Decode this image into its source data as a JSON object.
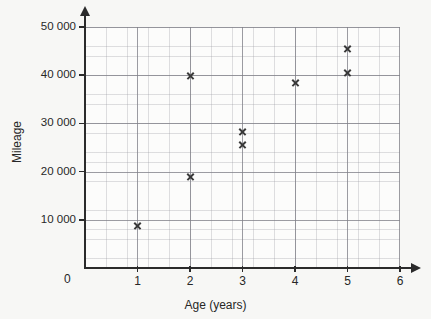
{
  "chart_data": {
    "type": "scatter",
    "title": "",
    "xlabel": "Age (years)",
    "ylabel": "Mileage",
    "xlim": [
      0,
      6
    ],
    "ylim": [
      0,
      50000
    ],
    "grid": true,
    "legend": "none",
    "x_ticks": [
      "0",
      "1",
      "2",
      "3",
      "4",
      "5",
      "6"
    ],
    "x_tick_values": [
      0,
      1,
      2,
      3,
      4,
      5,
      6
    ],
    "y_ticks": [
      "10 000",
      "20 000",
      "30 000",
      "40 000",
      "50 000"
    ],
    "y_tick_values": [
      10000,
      20000,
      30000,
      40000,
      50000
    ],
    "origin_label": "0",
    "marker": "x",
    "marker_color": "#3a3a3a",
    "points": [
      {
        "x": 1,
        "y": 8700
      },
      {
        "x": 2,
        "y": 18800
      },
      {
        "x": 2,
        "y": 39800
      },
      {
        "x": 3,
        "y": 28200
      },
      {
        "x": 3,
        "y": 25600
      },
      {
        "x": 4,
        "y": 38500
      },
      {
        "x": 5,
        "y": 40500
      },
      {
        "x": 5,
        "y": 45500
      }
    ]
  },
  "colors": {
    "background": "#f7f7f5",
    "axis": "#2b2b2b",
    "grid_major": "#808088",
    "grid_minor": "#96969e",
    "text": "#272727"
  }
}
